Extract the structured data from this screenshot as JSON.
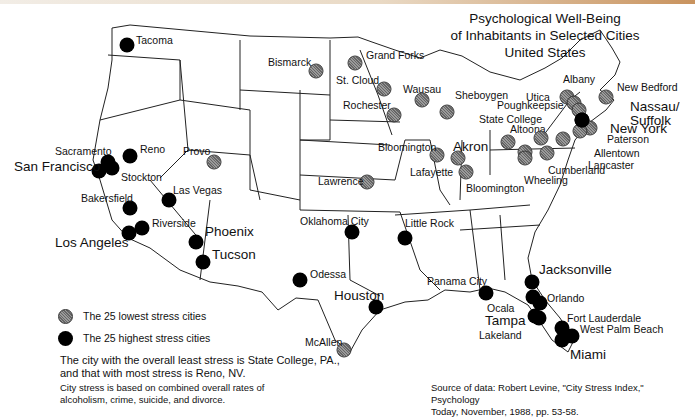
{
  "title": {
    "line1": "Psychological  Well-Being",
    "line2": "of Inhabitants in Selected Cities",
    "line3": "United States"
  },
  "legend": {
    "low": {
      "label": "The 25 lowest stress cities",
      "color": "#8a8a8a",
      "icon": "hatched-circle"
    },
    "high": {
      "label": "The 25 highest stress cities",
      "color": "#000000",
      "icon": "solid-circle"
    }
  },
  "notes": {
    "summary": "The city with the overall least stress is State College, PA., and that with most stress is Reno, NV.",
    "summary_line1": "The city with the overall least stress is State College, PA.,",
    "summary_line2": "and that with most stress is Reno, NV.",
    "method_line1": "City stress is based on combined overall rates of",
    "method_line2": "alcoholism, crime, suicide, and divorce."
  },
  "source": {
    "line1": "Source of data: Robert Levine, \"City Stress Index,\"  Psychology",
    "line2": "Today, November, 1988, pp. 53-58."
  },
  "cities": [
    {
      "name": "Tacoma",
      "type": "high",
      "x": 127,
      "y": 45,
      "lx": 136,
      "ly": 35,
      "big": false
    },
    {
      "name": "Reno",
      "type": "high",
      "x": 130,
      "y": 156,
      "lx": 140,
      "ly": 144,
      "big": false
    },
    {
      "name": "Sacramento",
      "type": "high",
      "x": 108,
      "y": 162,
      "lx": 55,
      "ly": 146,
      "big": false
    },
    {
      "name": "Stockton",
      "type": "high",
      "x": 112,
      "y": 168,
      "lx": 121,
      "ly": 172,
      "big": false
    },
    {
      "name": "San Francisco",
      "type": "high",
      "x": 99,
      "y": 171,
      "lx": 14,
      "ly": 160,
      "big": true
    },
    {
      "name": "Bakersfield",
      "type": "high",
      "x": 130,
      "y": 208,
      "lx": 81,
      "ly": 193,
      "big": false
    },
    {
      "name": "Las Vegas",
      "type": "high",
      "x": 169,
      "y": 200,
      "lx": 173,
      "ly": 185,
      "big": false
    },
    {
      "name": "Riverside",
      "type": "high",
      "x": 142,
      "y": 228,
      "lx": 152,
      "ly": 218,
      "big": false
    },
    {
      "name": "Los Angeles",
      "type": "high",
      "x": 129,
      "y": 233,
      "lx": 55,
      "ly": 236,
      "big": true
    },
    {
      "name": "Phoenix",
      "type": "high",
      "x": 196,
      "y": 242,
      "lx": 205,
      "ly": 225,
      "big": true
    },
    {
      "name": "Tucson",
      "type": "high",
      "x": 203,
      "y": 262,
      "lx": 212,
      "ly": 248,
      "big": true
    },
    {
      "name": "Provo",
      "type": "low",
      "x": 214,
      "y": 162,
      "lx": 183,
      "ly": 146,
      "big": false
    },
    {
      "name": "Bismarck",
      "type": "low",
      "x": 316,
      "y": 71,
      "lx": 268,
      "ly": 57,
      "big": false
    },
    {
      "name": "Grand Forks",
      "type": "low",
      "x": 355,
      "y": 63,
      "lx": 366,
      "ly": 50,
      "big": false
    },
    {
      "name": "St. Cloud",
      "type": "low",
      "x": 384,
      "y": 89,
      "lx": 336,
      "ly": 75,
      "big": false
    },
    {
      "name": "Rochester",
      "type": "low",
      "x": 394,
      "y": 115,
      "lx": 343,
      "ly": 100,
      "big": false
    },
    {
      "name": "Wausau",
      "type": "low",
      "x": 422,
      "y": 100,
      "lx": 403,
      "ly": 84,
      "big": false
    },
    {
      "name": "Sheboygen",
      "type": "low",
      "x": 447,
      "y": 112,
      "lx": 455,
      "ly": 90,
      "big": false
    },
    {
      "name": "Lawrence",
      "type": "low",
      "x": 367,
      "y": 182,
      "lx": 318,
      "ly": 176,
      "big": false
    },
    {
      "name": "Bloomington",
      "type": "low",
      "x": 437,
      "y": 155,
      "lx": 378,
      "ly": 142,
      "big": false
    },
    {
      "name": "Lafayette",
      "type": "low",
      "x": 458,
      "y": 158,
      "lx": 410,
      "ly": 167,
      "big": false
    },
    {
      "name": "Bloomington",
      "type": "low",
      "x": 466,
      "y": 172,
      "lx": 466,
      "ly": 183,
      "big": false
    },
    {
      "name": "Akron",
      "type": "low",
      "x": 508,
      "y": 142,
      "lx": 453,
      "ly": 140,
      "big": true
    },
    {
      "name": "Altoona",
      "type": "low",
      "x": 525,
      "y": 152,
      "lx": 510,
      "ly": 124,
      "big": false
    },
    {
      "name": "State College",
      "type": "low",
      "x": 541,
      "y": 138,
      "lx": 479,
      "ly": 114,
      "big": false
    },
    {
      "name": "Wheeling",
      "type": "low",
      "x": 525,
      "y": 158,
      "lx": 524,
      "ly": 175,
      "big": false
    },
    {
      "name": "Cumberland",
      "type": "low",
      "x": 547,
      "y": 153,
      "lx": 548,
      "ly": 165,
      "big": false
    },
    {
      "name": "Albany",
      "type": "low",
      "x": 567,
      "y": 97,
      "lx": 563,
      "ly": 74,
      "big": false
    },
    {
      "name": "Utica",
      "type": "low",
      "x": 574,
      "y": 103,
      "lx": 526,
      "ly": 92,
      "big": false
    },
    {
      "name": "Poughkeepsie",
      "type": "low",
      "x": 579,
      "y": 110,
      "lx": 497,
      "ly": 100,
      "big": false
    },
    {
      "name": "New Bedford",
      "type": "low",
      "x": 606,
      "y": 97,
      "lx": 617,
      "ly": 82,
      "big": false
    },
    {
      "name": "Paterson",
      "type": "low",
      "x": 590,
      "y": 128,
      "lx": 607,
      "ly": 134,
      "big": false
    },
    {
      "name": "Allentown",
      "type": "low",
      "x": 580,
      "y": 131,
      "lx": 594,
      "ly": 148,
      "big": false
    },
    {
      "name": "Lancaster",
      "type": "low",
      "x": 563,
      "y": 139,
      "lx": 588,
      "ly": 160,
      "big": false
    },
    {
      "name": "Nassau/ Suffolk",
      "type": "high",
      "x": 582,
      "y": 120,
      "lx": 630,
      "ly": 100,
      "big": true
    },
    {
      "name": "New York",
      "type": "high",
      "x": 582,
      "y": 120,
      "lx": 610,
      "ly": 122,
      "big": true
    },
    {
      "name": "Oklahoma City",
      "type": "high",
      "x": 352,
      "y": 232,
      "lx": 300,
      "ly": 216,
      "big": false
    },
    {
      "name": "Little Rock",
      "type": "high",
      "x": 405,
      "y": 238,
      "lx": 405,
      "ly": 218,
      "big": false
    },
    {
      "name": "Odessa",
      "type": "high",
      "x": 300,
      "y": 280,
      "lx": 310,
      "ly": 269,
      "big": false
    },
    {
      "name": "Houston",
      "type": "high",
      "x": 376,
      "y": 307,
      "lx": 334,
      "ly": 289,
      "big": true
    },
    {
      "name": "McAllen",
      "type": "low",
      "x": 344,
      "y": 350,
      "lx": 305,
      "ly": 337,
      "big": false
    },
    {
      "name": "Panama City",
      "type": "high",
      "x": 486,
      "y": 293,
      "lx": 427,
      "ly": 276,
      "big": false
    },
    {
      "name": "Jacksonville",
      "type": "high",
      "x": 532,
      "y": 282,
      "lx": 539,
      "ly": 263,
      "big": true
    },
    {
      "name": "Orlando",
      "type": "high",
      "x": 540,
      "y": 303,
      "lx": 547,
      "ly": 293,
      "big": false
    },
    {
      "name": "Ocala",
      "type": "high",
      "x": 533,
      "y": 297,
      "lx": 487,
      "ly": 303,
      "big": false
    },
    {
      "name": "Tampa",
      "type": "high",
      "x": 535,
      "y": 316,
      "lx": 485,
      "ly": 314,
      "big": true
    },
    {
      "name": "Lakeland",
      "type": "high",
      "x": 539,
      "y": 318,
      "lx": 479,
      "ly": 330,
      "big": false
    },
    {
      "name": "Fort Lauderdale",
      "type": "high",
      "x": 562,
      "y": 328,
      "lx": 567,
      "ly": 313,
      "big": false
    },
    {
      "name": "West Palm Beach",
      "type": "high",
      "x": 572,
      "y": 336,
      "lx": 580,
      "ly": 324,
      "big": false
    },
    {
      "name": "Miami",
      "type": "high",
      "x": 562,
      "y": 340,
      "lx": 570,
      "ly": 348,
      "big": true
    }
  ]
}
